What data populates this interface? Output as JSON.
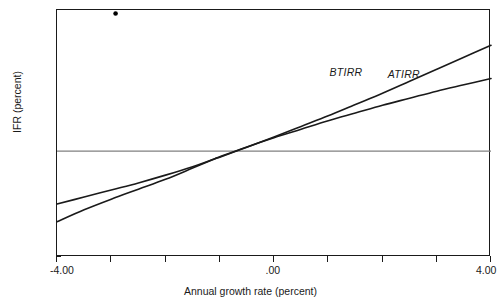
{
  "chart_data": {
    "type": "line",
    "title": "",
    "xlabel": "Annual growth rate (percent)",
    "ylabel": "IFR (percent)",
    "xlim": [
      -4.0,
      4.0
    ],
    "ylim": [
      -15,
      20
    ],
    "grid": false,
    "legend_position": "inline-annotations",
    "x_tick_labels": [
      "-4.00",
      ".00",
      "4.00"
    ],
    "x_tick_values": [
      -4.0,
      0.0,
      4.0
    ],
    "x_minor_tick_values": [
      -3.0,
      -2.0,
      -1.0,
      1.0,
      2.0,
      3.0
    ],
    "y_tick_labels": [
      "20",
      "15",
      "10",
      "5",
      "0",
      "-5",
      "-10",
      "-15"
    ],
    "y_tick_values": [
      20,
      15,
      10,
      5,
      0,
      -5,
      -10,
      -15
    ],
    "zero_line": 0,
    "series": [
      {
        "name": "BTIRR",
        "label": "BTIRR",
        "x": [
          -4.0,
          -3.5,
          -3.0,
          -2.5,
          -2.0,
          -1.5,
          -1.1,
          -1.0,
          -0.5,
          0.0,
          0.5,
          1.0,
          1.5,
          2.0,
          2.5,
          3.0,
          3.5,
          4.0
        ],
        "y": [
          -7.5,
          -6.5,
          -5.5,
          -4.5,
          -3.4,
          -2.2,
          -1.1,
          -0.85,
          0.55,
          2.0,
          3.5,
          5.0,
          6.6,
          8.2,
          9.9,
          11.6,
          13.3,
          15.0
        ]
      },
      {
        "name": "ATIRR",
        "label": "ATIRR",
        "x": [
          -4.0,
          -3.5,
          -3.0,
          -2.5,
          -2.0,
          -1.5,
          -1.1,
          -1.0,
          -0.5,
          0.0,
          0.5,
          1.0,
          1.5,
          2.0,
          2.5,
          3.0,
          3.5,
          4.0
        ],
        "y": [
          -10.0,
          -8.3,
          -6.8,
          -5.4,
          -4.0,
          -2.4,
          -1.1,
          -0.8,
          0.6,
          1.9,
          3.1,
          4.3,
          5.4,
          6.5,
          7.5,
          8.5,
          9.4,
          10.3
        ]
      }
    ],
    "markers": [
      {
        "name": "outlier-point",
        "x": -2.92,
        "y": 19.5
      }
    ],
    "colors": {
      "axis": "#1a1a1a",
      "curve": "#1a1a1a",
      "zero_line": "#808080",
      "marker": "#000000",
      "background": "#ffffff"
    }
  }
}
